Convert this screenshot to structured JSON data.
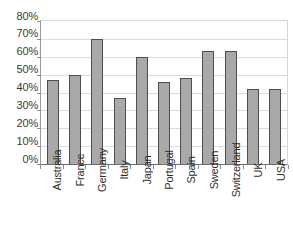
{
  "chart_data": {
    "type": "bar",
    "title": "",
    "subtitle": "",
    "xlabel": "",
    "ylabel": "",
    "categories": [
      "Australia",
      "France",
      "Germany",
      "Italy",
      "Japan",
      "Portugal",
      "Spain",
      "Sweden",
      "Switzerland",
      "UK",
      "USA"
    ],
    "values": [
      47,
      50,
      70,
      37,
      60,
      46,
      48,
      63,
      63,
      42,
      42
    ],
    "value_unit": "%",
    "ylim": [
      0,
      80
    ],
    "ytick_values": [
      0,
      10,
      20,
      30,
      40,
      50,
      60,
      70,
      80
    ],
    "ytick_labels": [
      "0%",
      "10%",
      "20%",
      "30%",
      "40%",
      "50%",
      "60%",
      "70%",
      "80%"
    ],
    "grid": true,
    "legend": false,
    "legend_position": "none",
    "series": [
      {
        "name": "",
        "values": [
          47,
          50,
          70,
          37,
          60,
          46,
          48,
          63,
          63,
          42,
          42
        ]
      }
    ],
    "colors": {
      "bar_fill": "#a9a9a9",
      "bar_border": "#4d4d4d",
      "gridline": "#dcdcdc",
      "axis": "#6e6e6e",
      "text": "#2e2e2e",
      "background": "#ffffff"
    }
  }
}
